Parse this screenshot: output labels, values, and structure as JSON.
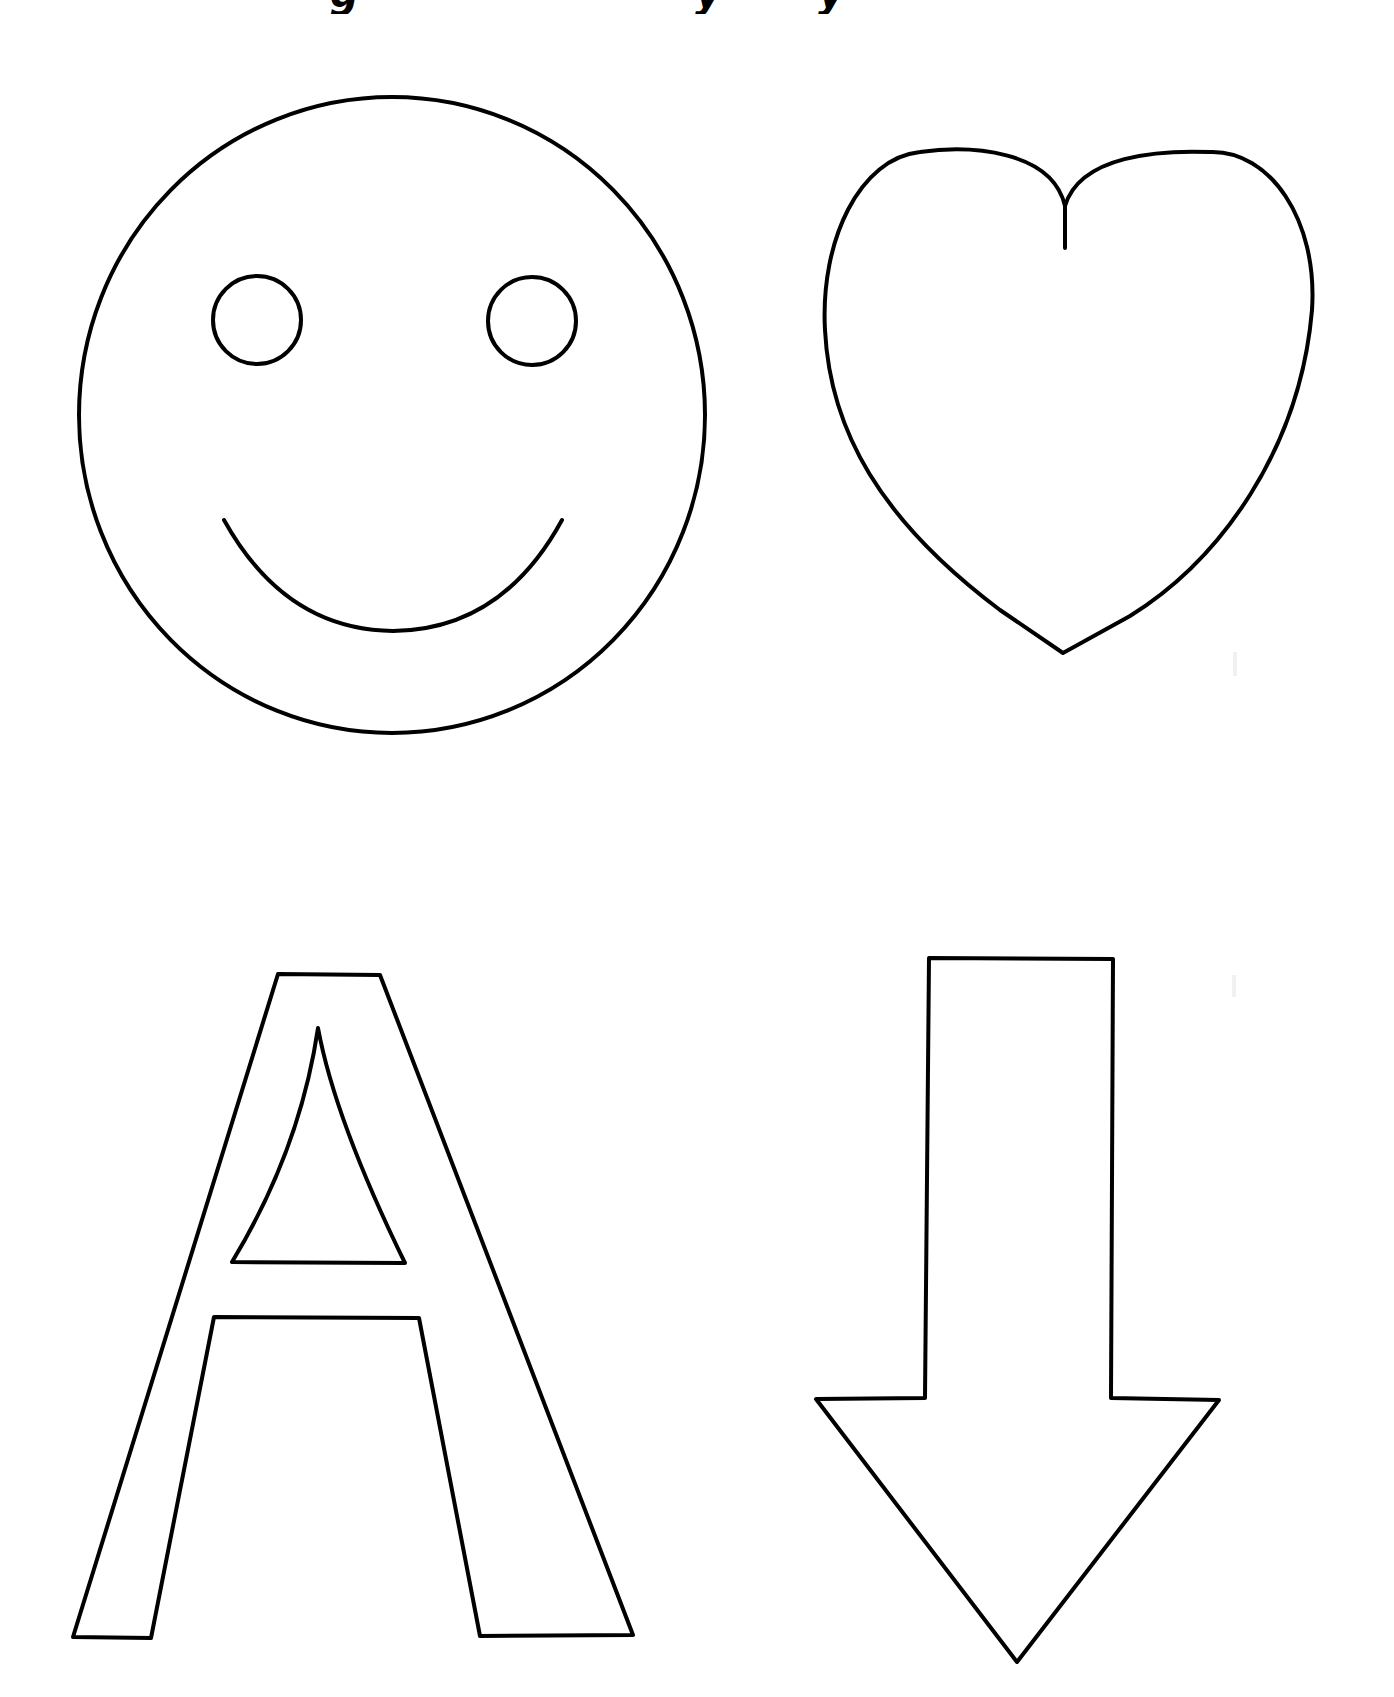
{
  "page": {
    "type": "coloring / tracing worksheet",
    "background": "#ffffff",
    "stroke_color": "#000000"
  },
  "header": {
    "title_fragments": [
      "g",
      "y",
      "y"
    ]
  },
  "shapes": [
    {
      "id": "smiley",
      "name": "Smiley face",
      "position": "top-left"
    },
    {
      "id": "heart",
      "name": "Heart",
      "position": "top-right"
    },
    {
      "id": "letter-a",
      "name": "Letter A",
      "position": "bottom-left"
    },
    {
      "id": "down-arrow",
      "name": "Down arrow",
      "position": "bottom-right"
    }
  ]
}
